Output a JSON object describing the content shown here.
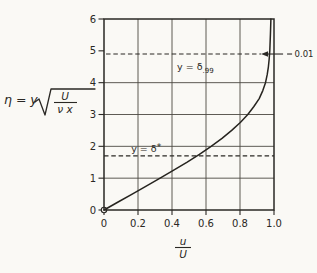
{
  "page": {
    "background": "#faf9f5",
    "ink": "#2a2824"
  },
  "axis_labels": {
    "eta_prefix": "η = y",
    "sqrt_numerator": "U",
    "sqrt_denominator": "ν x",
    "x_frac_numerator": "u",
    "x_frac_denominator": "U"
  },
  "chart_data": {
    "type": "line",
    "xlabel": "u/U",
    "ylabel": "η = y √(U/νx)",
    "xlim": [
      0,
      1.0
    ],
    "ylim": [
      0,
      6
    ],
    "grid": true,
    "x_gridlines": [
      0.2,
      0.4,
      0.6,
      0.8
    ],
    "y_gridlines": [
      1,
      2,
      3,
      4
    ],
    "x_ticks": [
      {
        "value": 0,
        "label": "0"
      },
      {
        "value": 0.2,
        "label": "0.2"
      },
      {
        "value": 0.4,
        "label": "0.4"
      },
      {
        "value": 0.6,
        "label": "0.6"
      },
      {
        "value": 0.8,
        "label": "0.8"
      },
      {
        "value": 1.0,
        "label": "1.0"
      }
    ],
    "y_ticks": [
      {
        "value": 0,
        "label": "0"
      },
      {
        "value": 1,
        "label": "1"
      },
      {
        "value": 2,
        "label": "2"
      },
      {
        "value": 3,
        "label": "3"
      },
      {
        "value": 4,
        "label": "4"
      },
      {
        "value": 5,
        "label": "5"
      },
      {
        "value": 6,
        "label": "6"
      }
    ],
    "series": [
      {
        "name": "velocity profile",
        "points": [
          [
            0,
            0
          ],
          [
            0.083,
            0.25
          ],
          [
            0.166,
            0.5
          ],
          [
            0.248,
            0.75
          ],
          [
            0.33,
            1.0
          ],
          [
            0.41,
            1.25
          ],
          [
            0.487,
            1.5
          ],
          [
            0.561,
            1.75
          ],
          [
            0.63,
            2.0
          ],
          [
            0.694,
            2.25
          ],
          [
            0.751,
            2.5
          ],
          [
            0.802,
            2.75
          ],
          [
            0.846,
            3.0
          ],
          [
            0.882,
            3.25
          ],
          [
            0.913,
            3.5
          ],
          [
            0.934,
            3.75
          ],
          [
            0.95,
            4.0
          ],
          [
            0.96,
            4.25
          ],
          [
            0.967,
            4.5
          ],
          [
            0.972,
            4.75
          ],
          [
            0.975,
            5.0
          ],
          [
            0.979,
            5.5
          ],
          [
            0.982,
            6.0
          ]
        ]
      }
    ],
    "annotations": [
      {
        "type": "dashed-line",
        "eta": 4.9,
        "u_start": 0.012,
        "u_end": 0.924,
        "label": {
          "main": "y = δ",
          "script": ".99",
          "script_pos": "sub",
          "u": 0.43,
          "eta": 4.4
        }
      },
      {
        "type": "dashed-line",
        "eta": 1.7,
        "u_start": 0.0,
        "u_end": 1.0,
        "label": {
          "main": "y = δ",
          "script": "*",
          "script_pos": "sup",
          "u": 0.16,
          "eta": 1.82
        }
      },
      {
        "type": "arrow",
        "text": "0.01",
        "eta": 4.9,
        "u_tip": 0.924
      },
      {
        "type": "marker",
        "shape": "open-circle",
        "u": 0,
        "eta": 0
      }
    ]
  }
}
